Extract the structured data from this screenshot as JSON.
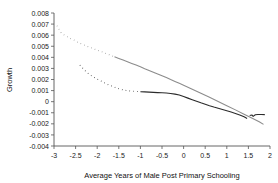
{
  "chart_data": {
    "type": "line",
    "title": "",
    "xlabel": "Average Years of Male Post Primary Schooling",
    "ylabel": "Growth",
    "xlim": [
      -3,
      2
    ],
    "ylim": [
      -0.004,
      0.008
    ],
    "grid": false,
    "legend": "none",
    "xticks": [
      "-3",
      "-2.5",
      "-2",
      "-1.5",
      "-1",
      "-0.5",
      "0",
      "0.5",
      "1",
      "1.5",
      "2"
    ],
    "xtick_values": [
      -3,
      -2.5,
      -2,
      -1.5,
      -1,
      -0.5,
      0,
      0.5,
      1,
      1.5,
      2
    ],
    "yticks": [
      "0.008",
      "0.007",
      "0.006",
      "0.005",
      "0.004",
      "0.003",
      "0.002",
      "0.001",
      "0",
      "-0.001",
      "-0.002",
      "-0.003",
      "-0.004"
    ],
    "ytick_values": [
      0.008,
      0.007,
      0.006,
      0.005,
      0.004,
      0.003,
      0.002,
      0.001,
      0,
      -0.001,
      -0.002,
      -0.003,
      -0.004
    ],
    "series": [
      {
        "name": "linear-fit",
        "color": "#8c8c8c",
        "width": 1.1,
        "dotted_left": true,
        "points": [
          [
            -2.93,
            0.00685
          ],
          [
            -2.88,
            0.0065
          ],
          [
            -2.84,
            0.00625
          ],
          [
            -2.78,
            0.00605
          ],
          [
            -2.72,
            0.00592
          ],
          [
            -2.66,
            0.00578
          ],
          [
            -2.6,
            0.00566
          ],
          [
            -2.54,
            0.00556
          ],
          [
            -2.47,
            0.0054
          ],
          [
            -2.4,
            0.00527
          ],
          [
            -2.33,
            0.00515
          ],
          [
            -2.26,
            0.00505
          ],
          [
            -2.18,
            0.00492
          ],
          [
            -2.1,
            0.0048
          ],
          [
            -2.02,
            0.00468
          ],
          [
            -1.94,
            0.00456
          ],
          [
            -1.86,
            0.00445
          ],
          [
            -1.78,
            0.00432
          ],
          [
            -1.7,
            0.0042
          ],
          [
            -1.6,
            0.00405
          ],
          [
            -1.5,
            0.0039
          ],
          [
            -1.4,
            0.00375
          ],
          [
            -1.3,
            0.0036
          ],
          [
            -1.2,
            0.00345
          ],
          [
            -1.1,
            0.0033
          ],
          [
            -1.0,
            0.00315
          ],
          [
            -0.9,
            0.00298
          ],
          [
            -0.8,
            0.00282
          ],
          [
            -0.7,
            0.00266
          ],
          [
            -0.6,
            0.0025
          ],
          [
            -0.5,
            0.00234
          ],
          [
            -0.4,
            0.00218
          ],
          [
            -0.3,
            0.002
          ],
          [
            -0.2,
            0.00183
          ],
          [
            -0.1,
            0.00166
          ],
          [
            0.0,
            0.00148
          ],
          [
            0.2,
            0.00112
          ],
          [
            0.4,
            0.00076
          ],
          [
            0.6,
            0.00039
          ],
          [
            0.8,
            2e-05
          ],
          [
            1.0,
            -0.00036
          ],
          [
            1.2,
            -0.00074
          ],
          [
            1.4,
            -0.00113
          ],
          [
            1.6,
            -0.00152
          ],
          [
            1.75,
            -0.00182
          ],
          [
            1.85,
            -0.00205
          ]
        ]
      },
      {
        "name": "nonparametric-fit",
        "color": "#2b2b2b",
        "width": 1.1,
        "dotted_left": true,
        "points": [
          [
            -2.4,
            0.0033
          ],
          [
            -2.33,
            0.003
          ],
          [
            -2.26,
            0.00272
          ],
          [
            -2.19,
            0.00248
          ],
          [
            -2.12,
            0.0023
          ],
          [
            -2.05,
            0.00215
          ],
          [
            -1.98,
            0.002
          ],
          [
            -1.91,
            0.00186
          ],
          [
            -1.84,
            0.00172
          ],
          [
            -1.77,
            0.00158
          ],
          [
            -1.7,
            0.00146
          ],
          [
            -1.62,
            0.00134
          ],
          [
            -1.54,
            0.00122
          ],
          [
            -1.46,
            0.00112
          ],
          [
            -1.38,
            0.00104
          ],
          [
            -1.3,
            0.00099
          ],
          [
            -1.2,
            0.00095
          ],
          [
            -1.1,
            0.00092
          ],
          [
            -1.0,
            0.0009
          ],
          [
            -0.9,
            0.00088
          ],
          [
            -0.8,
            0.00086
          ],
          [
            -0.7,
            0.00084
          ],
          [
            -0.6,
            0.00082
          ],
          [
            -0.5,
            0.0008
          ],
          [
            -0.4,
            0.00078
          ],
          [
            -0.3,
            0.00074
          ],
          [
            -0.2,
            0.00068
          ],
          [
            -0.1,
            0.0006
          ],
          [
            0.0,
            0.00046
          ],
          [
            0.1,
            0.00032
          ],
          [
            0.2,
            0.00018
          ],
          [
            0.3,
            4e-05
          ],
          [
            0.4,
            -0.0001
          ],
          [
            0.5,
            -0.00023
          ],
          [
            0.6,
            -0.00036
          ],
          [
            0.7,
            -0.00048
          ],
          [
            0.8,
            -0.00059
          ],
          [
            0.9,
            -0.0007
          ],
          [
            1.0,
            -0.00082
          ],
          [
            1.1,
            -0.00094
          ],
          [
            1.2,
            -0.00106
          ],
          [
            1.3,
            -0.0012
          ],
          [
            1.4,
            -0.00137
          ],
          [
            1.47,
            -0.00152
          ]
        ],
        "tail_points": [
          [
            1.53,
            -0.00125
          ],
          [
            1.58,
            -0.0012
          ],
          [
            1.61,
            -0.00133
          ],
          [
            1.66,
            -0.00118
          ],
          [
            1.72,
            -0.00116
          ],
          [
            1.8,
            -0.00116
          ],
          [
            1.88,
            -0.00117
          ]
        ]
      }
    ]
  }
}
